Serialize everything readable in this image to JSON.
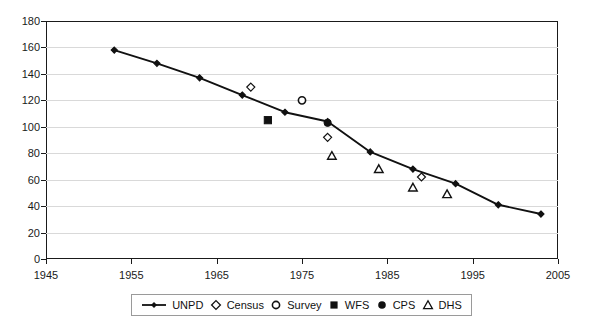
{
  "chart_data": {
    "type": "line",
    "title": "",
    "subtitle": "",
    "xlabel": "",
    "ylabel": "",
    "xlim": [
      1945,
      2005
    ],
    "ylim": [
      0,
      180
    ],
    "xticks": [
      1945,
      1955,
      1965,
      1975,
      1985,
      1995,
      2005
    ],
    "yticks": [
      0,
      20,
      40,
      60,
      80,
      100,
      120,
      140,
      160,
      180
    ],
    "grid": "horizontal",
    "legend_position": "bottom",
    "series": [
      {
        "name": "UNPD",
        "marker": "line-with-small-diamond",
        "style": "line",
        "color": "#111111",
        "points": [
          {
            "x": 1953,
            "y": 158
          },
          {
            "x": 1958,
            "y": 148
          },
          {
            "x": 1963,
            "y": 137
          },
          {
            "x": 1968,
            "y": 124
          },
          {
            "x": 1973,
            "y": 111
          },
          {
            "x": 1978,
            "y": 104
          },
          {
            "x": 1983,
            "y": 81
          },
          {
            "x": 1988,
            "y": 68
          },
          {
            "x": 1993,
            "y": 57
          },
          {
            "x": 1998,
            "y": 41
          },
          {
            "x": 2003,
            "y": 34
          }
        ]
      },
      {
        "name": "Census",
        "marker": "open-diamond",
        "style": "scatter",
        "color": "#111111",
        "points": [
          {
            "x": 1969,
            "y": 130
          },
          {
            "x": 1978,
            "y": 92
          },
          {
            "x": 1989,
            "y": 62
          }
        ]
      },
      {
        "name": "Survey",
        "marker": "open-circle",
        "style": "scatter",
        "color": "#111111",
        "points": [
          {
            "x": 1975,
            "y": 120
          }
        ]
      },
      {
        "name": "WFS",
        "marker": "filled-square",
        "style": "scatter",
        "color": "#111111",
        "points": [
          {
            "x": 1971,
            "y": 105
          }
        ]
      },
      {
        "name": "CPS",
        "marker": "filled-circle",
        "style": "scatter",
        "color": "#111111",
        "points": [
          {
            "x": 1978,
            "y": 103
          }
        ]
      },
      {
        "name": "DHS",
        "marker": "open-triangle",
        "style": "scatter",
        "color": "#111111",
        "points": [
          {
            "x": 1978.5,
            "y": 78
          },
          {
            "x": 1984,
            "y": 68
          },
          {
            "x": 1988,
            "y": 54
          },
          {
            "x": 1992,
            "y": 49
          }
        ]
      }
    ]
  },
  "legend": {
    "items": [
      {
        "label": "UNPD",
        "glyph": "line-diamond-icon"
      },
      {
        "label": "Census",
        "glyph": "open-diamond-icon"
      },
      {
        "label": "Survey",
        "glyph": "open-circle-icon"
      },
      {
        "label": "WFS",
        "glyph": "filled-square-icon"
      },
      {
        "label": "CPS",
        "glyph": "filled-circle-icon"
      },
      {
        "label": "DHS",
        "glyph": "open-triangle-icon"
      }
    ]
  },
  "axes": {
    "y_labels": [
      "180",
      "160",
      "140",
      "120",
      "100",
      "80",
      "60",
      "40",
      "20",
      "0"
    ],
    "x_labels": [
      "1945",
      "1955",
      "1965",
      "1975",
      "1985",
      "1995",
      "2005"
    ]
  }
}
